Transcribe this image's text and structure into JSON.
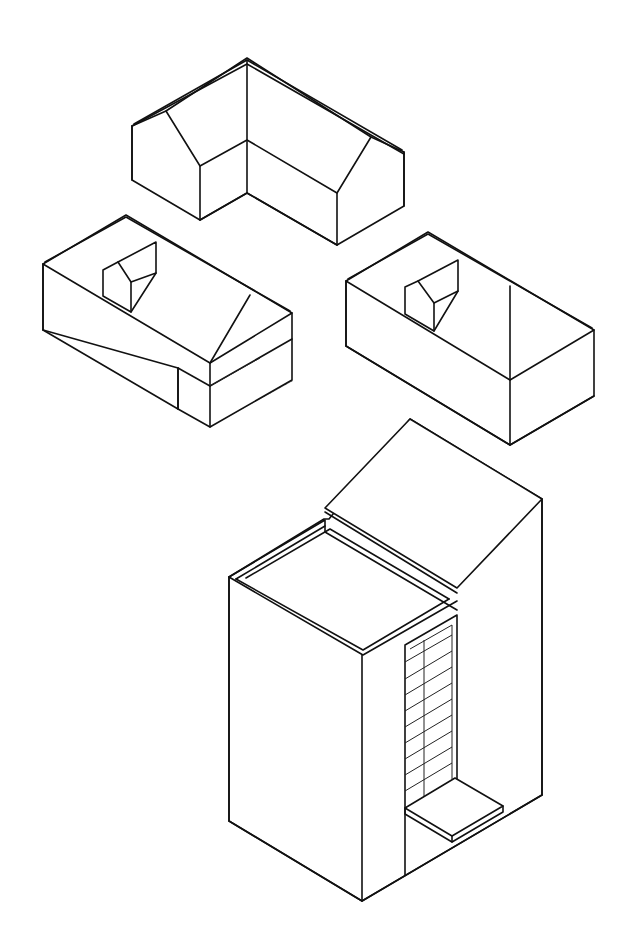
{
  "figure": {
    "colors": {
      "line": "#111111",
      "shadow": "#8a8a8a",
      "background": "#ffffff"
    },
    "buildings": [
      {
        "id": "l-shaped-gable-house",
        "position": "top-center"
      },
      {
        "id": "hip-roof-house-with-dormer-and-carport",
        "position": "middle-left"
      },
      {
        "id": "gable-house-with-dormer",
        "position": "middle-right"
      },
      {
        "id": "tall-block-with-shed-roof-and-window-bay",
        "position": "bottom-center"
      }
    ]
  }
}
